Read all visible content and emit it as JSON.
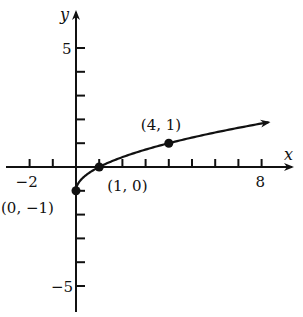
{
  "chart_data": {
    "type": "line",
    "title": "",
    "xlabel": "x",
    "ylabel": "y",
    "xlim": [
      -3,
      9
    ],
    "ylim": [
      -6,
      6
    ],
    "grid": false,
    "x_ticks": [
      -2,
      -1,
      1,
      2,
      3,
      4,
      5,
      6,
      7,
      8
    ],
    "x_tick_labels": [
      {
        "value": -2,
        "label": "−2"
      },
      {
        "value": 8,
        "label": "8"
      }
    ],
    "y_ticks": [
      -5,
      -4,
      -3,
      -2,
      -1,
      1,
      2,
      3,
      4,
      5
    ],
    "y_tick_labels": [
      {
        "value": 5,
        "label": "5"
      },
      {
        "value": -5,
        "label": "−5"
      }
    ],
    "series": [
      {
        "name": "y = √x − 1",
        "function": "sqrt(x) - 1",
        "x": [
          0,
          0.25,
          1,
          2,
          4,
          6,
          8.3
        ],
        "values": [
          -1,
          -0.5,
          0,
          0.41,
          1,
          1.45,
          1.88
        ],
        "arrow_end": true
      }
    ],
    "points": [
      {
        "x": 0,
        "y": -1,
        "label": "(0, −1)"
      },
      {
        "x": 1,
        "y": 0,
        "label": "(1, 0)"
      },
      {
        "x": 4,
        "y": 1,
        "label": "(4, 1)"
      }
    ]
  }
}
